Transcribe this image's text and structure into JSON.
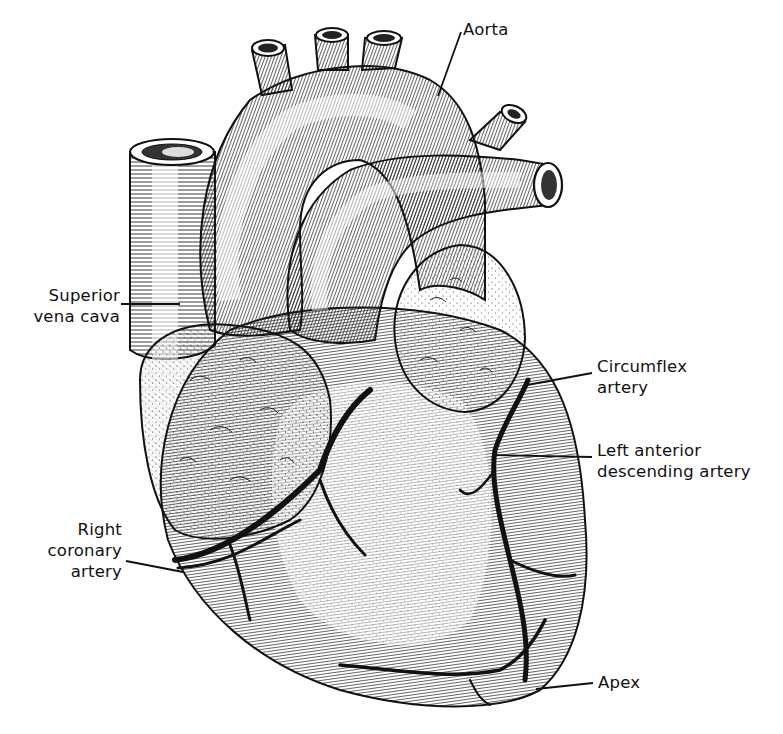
{
  "diagram": {
    "colors": {
      "ink": "#111111",
      "background": "#ffffff",
      "hatch": "#222222"
    },
    "labels": [
      {
        "id": "aorta",
        "lines": [
          "Aorta"
        ],
        "x": 463,
        "y": 19,
        "align": "left",
        "leader": {
          "x1": 461,
          "y1": 32,
          "x2": 438,
          "y2": 96
        }
      },
      {
        "id": "superior-vena-cava",
        "lines": [
          "Superior",
          "vena cava"
        ],
        "x": 40,
        "y": 285,
        "align": "right",
        "width": 100,
        "leader": {
          "x1": 121,
          "y1": 304,
          "x2": 180,
          "y2": 304
        }
      },
      {
        "id": "circumflex-artery",
        "lines": [
          "Circumflex",
          "artery"
        ],
        "x": 597,
        "y": 356,
        "align": "left",
        "leader": {
          "x1": 592,
          "y1": 373,
          "x2": 527,
          "y2": 385
        }
      },
      {
        "id": "left-anterior-descending-artery",
        "lines": [
          "Left anterior",
          "descending artery"
        ],
        "x": 597,
        "y": 440,
        "align": "left",
        "leader": {
          "x1": 592,
          "y1": 457,
          "x2": 493,
          "y2": 455
        }
      },
      {
        "id": "right-coronary-artery",
        "lines": [
          "Right",
          "coronary",
          "artery"
        ],
        "x": 40,
        "y": 519,
        "align": "right",
        "width": 78,
        "leader": {
          "x1": 126,
          "y1": 561,
          "x2": 183,
          "y2": 572
        }
      },
      {
        "id": "apex",
        "lines": [
          "Apex"
        ],
        "x": 598,
        "y": 670,
        "align": "left",
        "leader": {
          "x1": 593,
          "y1": 683,
          "x2": 536,
          "y2": 689
        }
      }
    ]
  }
}
